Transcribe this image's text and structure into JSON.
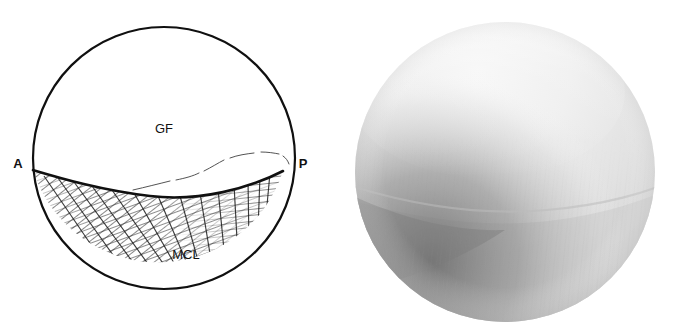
{
  "figure": {
    "type": "two-panel-medical-figure",
    "background_color": "#ffffff",
    "panels": [
      {
        "id": "schematic",
        "kind": "line-drawing",
        "shape": "circle",
        "description": "Arthroscopic view schematic of the glenohumeral joint"
      },
      {
        "id": "photograph",
        "kind": "grayscale-arthroscopic-photo",
        "shape": "circle",
        "description": "Corresponding arthroscopic photograph"
      }
    ]
  },
  "schematic": {
    "circle": {
      "cx": 164,
      "cy": 158,
      "r": 131,
      "stroke_color": "#101010",
      "stroke_width": 2.2,
      "fill": "#ffffff"
    },
    "labels": {
      "anterior": "A",
      "posterior": "P",
      "glenoid_fossa": "GF",
      "middle_glenohumeral_ligament": "MCL"
    },
    "label_positions": {
      "anterior": {
        "x": 18,
        "y": 168
      },
      "posterior": {
        "x": 303,
        "y": 168
      },
      "glenoid_fossa": {
        "x": 164,
        "y": 133
      },
      "middle_glenohumeral_ligament": {
        "x": 186,
        "y": 259
      }
    },
    "boundary_line": {
      "name": "glenoid-labral-boundary",
      "stroke_color": "#101010",
      "stroke_width": 2.4
    },
    "fold_line": {
      "name": "synovial-fold-line",
      "stroke_color": "#4a4a4a",
      "stroke_width": 0.9,
      "style": "thin-broken-wavy"
    },
    "hatching": {
      "name": "ligament-hatching",
      "stroke_color": "#2b2b2b",
      "description": "Dense diagonal hatch lines, shallow on the left fanning to near-vertical on the right"
    }
  },
  "photo": {
    "circle": {
      "cx": 505,
      "cy": 172,
      "r": 150
    },
    "tones": {
      "highlight": "#f2f2f2",
      "upper_body": "#e3e3e3",
      "mid_body": "#d6d6d6",
      "lower_body": "#c9c9c9",
      "shadow": "#8e8e8e",
      "deep_shadow": "#6f6f6f"
    },
    "features": {
      "bright_dome": "Bright convex humeral/glenoid surface filling the upper portion",
      "shadow_band": "Dark curved shadow band across the lower-left quadrant",
      "fiber_striations": "Faint near-vertical ligament fiber striations in the lower half"
    }
  }
}
